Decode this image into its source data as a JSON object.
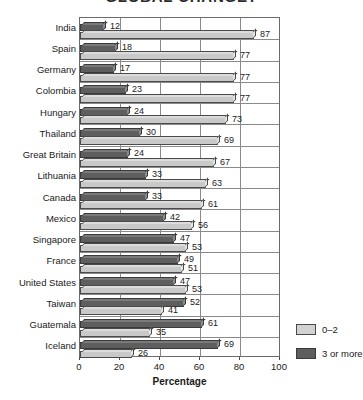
{
  "chart_data": {
    "type": "bar",
    "orientation": "horizontal",
    "title": "GLOBAL CHANGE?",
    "xlabel": "Percentage",
    "ylabel": "",
    "xlim": [
      0,
      100
    ],
    "xticks": [
      0,
      20,
      40,
      60,
      80,
      100
    ],
    "grid": true,
    "legend_position": "right-bottom",
    "categories": [
      "India",
      "Spain",
      "Germany",
      "Colombia",
      "Hungary",
      "Thailand",
      "Great Britain",
      "Lithuania",
      "Canada",
      "Mexico",
      "Singapore",
      "France",
      "United States",
      "Taiwan",
      "Guatemala",
      "Iceland"
    ],
    "series": [
      {
        "name": "3 or more",
        "color": "#5e5e5e",
        "values": [
          12,
          18,
          17,
          23,
          24,
          30,
          24,
          33,
          33,
          42,
          47,
          49,
          47,
          52,
          61,
          69
        ]
      },
      {
        "name": "0–2",
        "color": "#c9c9c9",
        "values": [
          87,
          77,
          77,
          77,
          73,
          69,
          67,
          63,
          61,
          56,
          53,
          51,
          53,
          41,
          35,
          26
        ]
      }
    ]
  },
  "legend": {
    "items": [
      {
        "label": "0–2",
        "swatch": "light"
      },
      {
        "label": "3 or more",
        "swatch": "dark"
      }
    ]
  }
}
